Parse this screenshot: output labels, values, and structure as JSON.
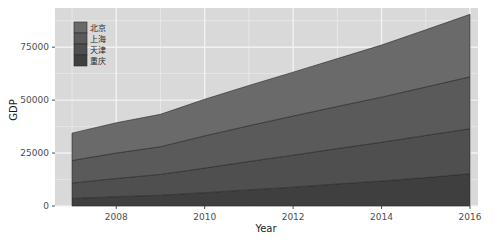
{
  "chart_data": {
    "type": "area",
    "title": "",
    "subtitle": "",
    "xlabel": "Year",
    "ylabel": "GDP",
    "stacked": true,
    "grid": true,
    "panel_background": "#d9d9d9",
    "grid_color": "#f2f2f2",
    "legend_position": "top-left-inside",
    "x": [
      2007,
      2008,
      2009,
      2010,
      2011,
      2012,
      2013,
      2014,
      2015,
      2016
    ],
    "xlim": [
      2007,
      2016
    ],
    "ylim": [
      0,
      93500
    ],
    "xticks": [
      "2008",
      "2010",
      "2012",
      "2014",
      "2016"
    ],
    "xtick_values": [
      2008,
      2010,
      2012,
      2014,
      2016
    ],
    "yticks": [
      "0",
      "25000",
      "50000",
      "75000"
    ],
    "ytick_values": [
      0,
      25000,
      50000,
      75000
    ],
    "series": [
      {
        "name": "重庆",
        "color": "#3f3f3f",
        "values": [
          3600,
          4400,
          5100,
          6300,
          7600,
          8900,
          10400,
          11800,
          13400,
          15200
        ]
      },
      {
        "name": "天津",
        "color": "#4f4f4f",
        "values": [
          7200,
          8600,
          9800,
          11600,
          13400,
          15100,
          16700,
          18300,
          19900,
          21300
        ]
      },
      {
        "name": "上海",
        "color": "#5a5a5a",
        "values": [
          10700,
          12000,
          13100,
          15200,
          16900,
          18500,
          19900,
          21300,
          22900,
          24500
        ]
      },
      {
        "name": "北京",
        "color": "#6a6a6a",
        "values": [
          12900,
          14300,
          15300,
          17300,
          19000,
          20700,
          22600,
          24600,
          27000,
          29500
        ]
      }
    ],
    "legend_entries": [
      {
        "label": "北京",
        "color": "#6a6a6a"
      },
      {
        "label": "上海",
        "color": "#5a5a5a"
      },
      {
        "label": "天津",
        "color": "#4f4f4f"
      },
      {
        "label": "重庆",
        "color": "#3f3f3f"
      }
    ]
  }
}
